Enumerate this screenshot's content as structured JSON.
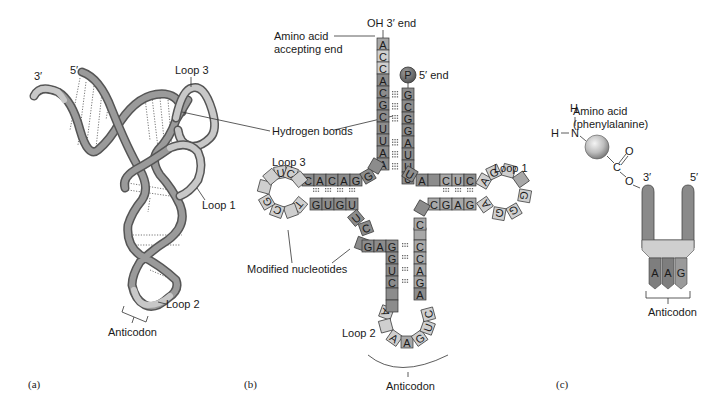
{
  "figure": {
    "panels": [
      {
        "id": "a",
        "label": "(a)",
        "title": "tRNA 3D folded structure"
      },
      {
        "id": "b",
        "label": "(b)",
        "title": "tRNA cloverleaf structure"
      },
      {
        "id": "c",
        "label": "(c)",
        "title": "tRNA simplified symbol"
      }
    ]
  },
  "panel_a": {
    "label": "(a)",
    "end_3": "3′",
    "end_5": "5′",
    "loop3": "Loop 3",
    "loop1": "Loop 1",
    "loop2": "Loop 2",
    "anticodon": "Anticodon"
  },
  "panel_b": {
    "label": "(b)",
    "oh_end": "OH 3′ end",
    "amino_acid_accepting_end_line1": "Amino acid",
    "amino_acid_accepting_end_line2": "accepting end",
    "phosphate": "P",
    "end_5": "5′ end",
    "hydrogen_bonds": "Hydrogen bonds",
    "loop3": "Loop 3",
    "loop1": "Loop 1",
    "loop2": "Loop 2",
    "modified_nucleotides": "Modified nucleotides",
    "anticodon": "Anticodon",
    "acceptor_stem_3prime": [
      "A",
      "C",
      "C",
      "A",
      "C",
      "G",
      "C",
      "U",
      "U",
      "A",
      "A"
    ],
    "acceptor_stem_5prime": [
      "G",
      "C",
      "G",
      "G",
      "A",
      "U",
      "U",
      "U"
    ],
    "d_arm_top": [
      "C",
      "A",
      "C",
      "A",
      "G"
    ],
    "d_arm_bottom": [
      "G",
      "U",
      "G",
      "U"
    ],
    "d_loop": [
      "U",
      "C",
      "G",
      "C",
      "",
      "T"
    ],
    "t_arm_top": [
      "A",
      "",
      "C",
      "U",
      "C"
    ],
    "t_arm_bottom": [
      "C",
      "G",
      "A",
      "G"
    ],
    "t_loop": [
      "A",
      "G",
      "",
      "",
      "G",
      "G",
      "A"
    ],
    "variable_region": [
      "U",
      "C",
      "G",
      "A",
      "G"
    ],
    "anticodon_stem_left": [
      "G",
      "G",
      "U",
      "C",
      ""
    ],
    "anticodon_stem_right": [
      "C",
      "C",
      "A",
      "G",
      "A"
    ],
    "anticodon_loop": [
      "A",
      "",
      "A",
      "A",
      "G",
      "U",
      "C"
    ]
  },
  "panel_c": {
    "label": "(c)",
    "amino_acid_line1": "Amino acid",
    "amino_acid_line2": "(phenylalanine)",
    "atoms": {
      "h1": "H",
      "h2": "H",
      "n": "N",
      "c": "C",
      "o_double": "O",
      "o_single": "O"
    },
    "end_3": "3′",
    "end_5": "5′",
    "anticodon_bases": [
      "A",
      "A",
      "G"
    ],
    "anticodon": "Anticodon"
  },
  "colors": {
    "dark_nt": "#8c8c8c",
    "mid_nt": "#a8a8a8",
    "light_nt": "#cfcfcf",
    "outline": "#333333",
    "phosphate": "#7a7a7a",
    "sphere": "#bdbdbd"
  }
}
